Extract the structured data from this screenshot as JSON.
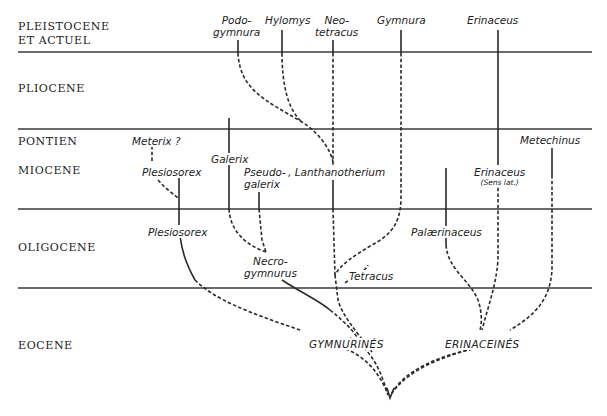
{
  "epochs": [
    {
      "label": "PLEISTOCENE",
      "label2": "ET ACTUEL"
    },
    {
      "label": "PLIOCENE"
    },
    {
      "label": "PONTIEN"
    },
    {
      "label": "MIOCENE"
    },
    {
      "label": "OLIGOCENE"
    },
    {
      "label": "EOCENE"
    }
  ],
  "taxa": {
    "podogymnura": {
      "line1": "Podo-",
      "line2": "gymnura"
    },
    "hylomys": "Hylomys",
    "neotetracus": {
      "line1": "Neo-",
      "line2": "tetracus"
    },
    "gymnura": "Gymnura",
    "erinaceus": "Erinaceus",
    "meterix": "Meterix ?",
    "galerix": "Galerix",
    "plesiosorex_miocene": "Plesiosorex",
    "pseudogalerix": {
      "line1": "Pseudo-",
      "line2": "galerix"
    },
    "lanthanotherium": ", Lanthanotherium",
    "erinaceus_sl": {
      "line1": "Erinaceus",
      "line2": "(Sens lat.)"
    },
    "metechinus": "Metechinus",
    "plesiosorex_oligocene": "Plesiosorex",
    "necrogymnurus": {
      "line1": "Necro-",
      "line2": "gymnurus"
    },
    "palaerinaceus": "Palærinaceus",
    "tetracus": "Tetracus"
  },
  "groups": {
    "gymnurines": "GYMNURINÉS",
    "erinaceines": "ERINACEINÉS"
  }
}
